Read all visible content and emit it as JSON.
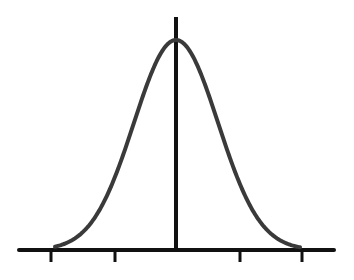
{
  "chart_data": {
    "type": "line",
    "title": "",
    "xlabel": "",
    "ylabel": "",
    "curve": "normal",
    "mean": 0,
    "sd": 1,
    "x_ticks": [
      -3,
      -1.5,
      1.5,
      3
    ],
    "x_tick_labels": [
      "",
      "",
      "",
      ""
    ],
    "xlim": [
      -3.7,
      3.8
    ],
    "grid": false,
    "legend": null,
    "colors": {
      "curve": "#3a3a3a",
      "axis": "#111111",
      "background": "#ffffff"
    }
  },
  "layout": {
    "axis_y": 250,
    "axis_x0": 19,
    "axis_x1": 334,
    "center_x": 176,
    "vline_top": 17,
    "peak_y": 40,
    "sigma_px": 42,
    "tick_xs": [
      51,
      115,
      240,
      302
    ],
    "tick_len": 12
  }
}
